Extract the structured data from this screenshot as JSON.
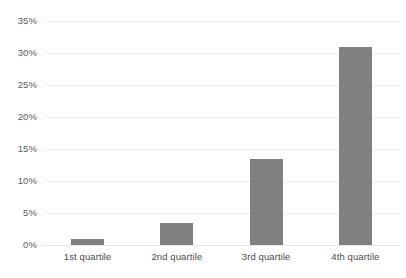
{
  "chart_data": {
    "type": "bar",
    "title": "",
    "subtitle": "",
    "xlabel": "",
    "ylabel": "",
    "categories": [
      "1st quartile",
      "2nd quartile",
      "3rd quartile",
      "4th quartile"
    ],
    "values": [
      1.0,
      3.4,
      13.4,
      31.0
    ],
    "value_labels": [
      "1%",
      "3.4%",
      "13.4%",
      "31%"
    ],
    "series": [
      {
        "name": "",
        "values": [
          1.0,
          3.4,
          13.4,
          31.0
        ],
        "color": "#808080"
      }
    ],
    "ylim": [
      0,
      35
    ],
    "ytick_values": [
      0,
      5,
      10,
      15,
      20,
      25,
      30,
      35
    ],
    "ytick_labels": [
      "0%",
      "5%",
      "10%",
      "15%",
      "20%",
      "25%",
      "30%",
      "35%"
    ],
    "grid": true,
    "grid_axis": "y",
    "grid_color": "#eceaea",
    "legend": false,
    "legend_position": "none",
    "background_color": "#ffffff",
    "bar_color": "#808080",
    "tick_label_color": "#5a5a5a"
  }
}
